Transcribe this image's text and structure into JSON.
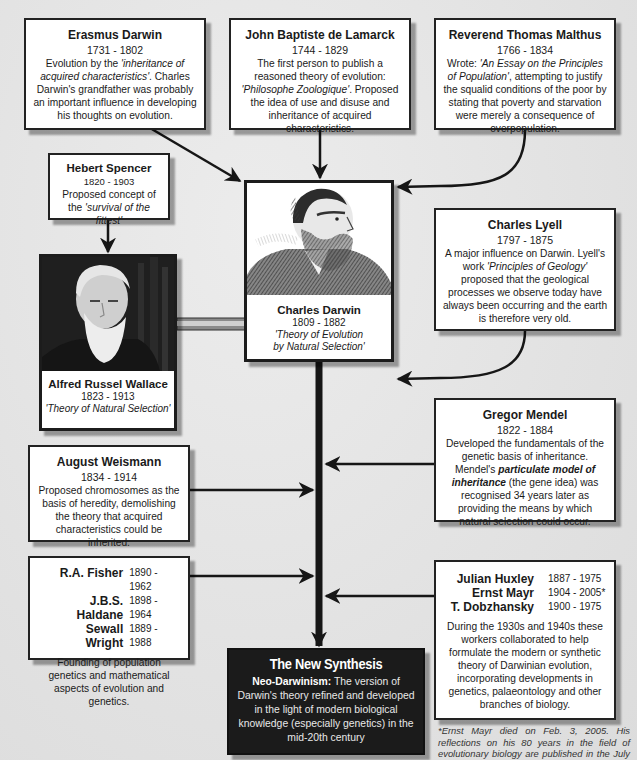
{
  "diagram": {
    "boxes": {
      "erasmus": {
        "name": "Erasmus Darwin",
        "dates": "1731 - 1802",
        "desc_pre": "Evolution by the ",
        "desc_italic": "'inheritance of acquired characteristics'",
        "desc_post": ". Charles Darwin's grandfather was probably an important influence in developing his thoughts on evolution."
      },
      "lamarck": {
        "name": "John Baptiste de Lamarck",
        "dates": "1744 - 1829",
        "desc_pre": "The first person to publish a reasoned theory of evolution: ",
        "desc_italic": "'Philosophe Zoologique'",
        "desc_post": ". Proposed the idea of use and disuse and inheritance of acquired characteristics."
      },
      "malthus": {
        "name": "Reverend Thomas Malthus",
        "dates": "1766 - 1834",
        "desc_pre": "Wrote: ",
        "desc_italic": "'An Essay on the Principles of Population'",
        "desc_post": ", attempting to justify the squalid conditions of the poor by stating that poverty and starvation were merely a consequence of overpopulation."
      },
      "spencer": {
        "name": "Hebert Spencer",
        "dates": "1820 - 1903",
        "desc_pre": "Proposed concept of the ",
        "desc_italic": "'survival of the fittest'"
      },
      "lyell": {
        "name": "Charles Lyell",
        "dates": "1797 - 1875",
        "desc_pre": "A major influence on Darwin. Lyell's work ",
        "desc_italic": "'Principles of Geology'",
        "desc_post": " proposed that the geological processes we observe today have always been occurring and the earth is therefore very old."
      },
      "mendel": {
        "name": "Gregor Mendel",
        "dates": "1822 - 1884",
        "desc_pre": "Developed the fundamentals of the genetic basis of inheritance. Mendel's ",
        "desc_bold_italic": "particulate model of inheritance",
        "desc_post": " (the gene idea) was recognised 34 years later as providing the means by which natural selection could occur."
      },
      "weismann": {
        "name": "August Weismann",
        "dates": "1834 - 1914",
        "desc": "Proposed chromosomes as the basis of heredity, demolishing the theory that acquired characteristics could be inherited."
      },
      "fisher_group": {
        "people": [
          {
            "name": "R.A. Fisher",
            "dates": "1890 - 1962"
          },
          {
            "name": "J.B.S. Haldane",
            "dates": "1898 - 1964"
          },
          {
            "name": "Sewall Wright",
            "dates": "1889 - 1988"
          }
        ],
        "desc": "Founding of population genetics and mathematical aspects of evolution and genetics."
      },
      "huxley_group": {
        "people": [
          {
            "name": "Julian Huxley",
            "dates": "1887 - 1975"
          },
          {
            "name": "Ernst Mayr",
            "dates": "1904 - 2005*"
          },
          {
            "name": "T. Dobzhansky",
            "dates": "1900 - 1975"
          }
        ],
        "desc": "During the 1930s and 1940s these workers collaborated to help formulate the modern or synthetic theory of Darwinian evolution, incorporating developments in genetics, palaeontology and other branches of biology."
      }
    },
    "portraits": {
      "darwin": {
        "name": "Charles Darwin",
        "dates": "1809 - 1882",
        "desc_line1": "'Theory of Evolution",
        "desc_line2": "by Natural Selection'"
      },
      "wallace": {
        "name": "Alfred Russel Wallace",
        "dates": "1823 - 1913",
        "desc": "'Theory of Natural Selection'"
      }
    },
    "synthesis": {
      "title": "The New Synthesis",
      "lead": "Neo-Darwinism:",
      "body": " The version of Darwin's theory refined and developed in the light of modern biological knowledge (especially genetics) in the mid-20th century"
    },
    "footnote": "*Ernst Mayr died on Feb. 3, 2005. His reflections on his 80 years in the field of evolutionary biology are published in the July 2, 2004 issue of Science.",
    "colors": {
      "background": "#e6e6e6",
      "box_fill": "#ffffff",
      "border": "#222222",
      "synthesis_fill": "#1b1b1b"
    }
  }
}
